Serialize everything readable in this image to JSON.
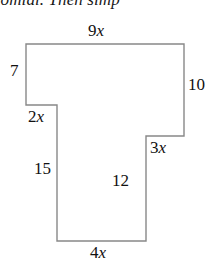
{
  "page": {
    "width": 216,
    "height": 268,
    "background_color": "#ffffff"
  },
  "instruction": {
    "text": "nomial. Then simp",
    "note": "partially cropped italic serif sentence at top of image"
  },
  "figure": {
    "name": "composite-polygon",
    "stroke_color": "#888888",
    "fill_color": "#ffffff",
    "stroke_width": 1.4,
    "points": "26,44 184,44 184,136 146,136 146,241 57,241 57,105 26,105",
    "vertices": [
      {
        "name": "top-left",
        "x": 26,
        "y": 44
      },
      {
        "name": "top-right",
        "x": 184,
        "y": 44
      },
      {
        "name": "right-lower",
        "x": 184,
        "y": 136
      },
      {
        "name": "right-notch-inner",
        "x": 146,
        "y": 136
      },
      {
        "name": "stem-bottom-right",
        "x": 146,
        "y": 241
      },
      {
        "name": "stem-bottom-left",
        "x": 57,
        "y": 241
      },
      {
        "name": "stem-top-left",
        "x": 57,
        "y": 105
      },
      {
        "name": "left-lower",
        "x": 26,
        "y": 105
      }
    ],
    "labels": {
      "top": {
        "id": "9x",
        "number": "9",
        "variable": "x",
        "edge": "top-horizontal"
      },
      "upper_left": {
        "id": "7",
        "number": "7",
        "variable": "",
        "edge": "left-vertical-upper"
      },
      "right": {
        "id": "10",
        "number": "10",
        "variable": "",
        "edge": "right-vertical"
      },
      "left_notch": {
        "id": "2x",
        "number": "2",
        "variable": "x",
        "edge": "left-notch-horizontal"
      },
      "right_notch": {
        "id": "3x",
        "number": "3",
        "variable": "x",
        "edge": "right-notch-horizontal"
      },
      "stem_left": {
        "id": "15",
        "number": "15",
        "variable": "",
        "edge": "stem-left-vertical"
      },
      "stem_right": {
        "id": "12",
        "number": "12",
        "variable": "",
        "edge": "stem-right-vertical"
      },
      "bottom": {
        "id": "4x",
        "number": "4",
        "variable": "x",
        "edge": "bottom-horizontal"
      }
    }
  }
}
